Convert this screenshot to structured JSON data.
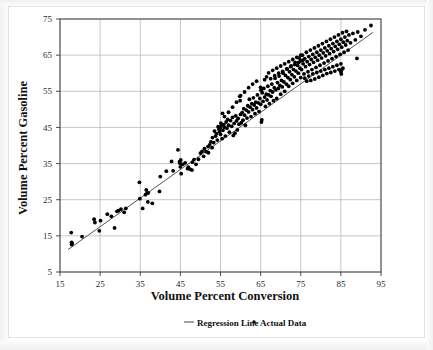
{
  "chart_data": {
    "type": "scatter",
    "title": "",
    "xlabel": "Volume Percent Conversion",
    "ylabel": "Volume Percent Gasoline",
    "xlim": [
      15,
      95
    ],
    "ylim": [
      5,
      75
    ],
    "xticks": [
      15,
      25,
      35,
      45,
      55,
      65,
      75,
      85,
      95
    ],
    "yticks": [
      5,
      15,
      25,
      35,
      45,
      55,
      65,
      75
    ],
    "grid": true,
    "legend_position": "below-bottom-center",
    "legend": [
      {
        "label": "Regression Line",
        "marker": "line",
        "color": "#555555"
      },
      {
        "label": "Actual Data",
        "marker": "dot",
        "color": "#000000"
      }
    ],
    "series": [
      {
        "name": "Regression Line",
        "type": "line",
        "color": "#555555",
        "slope": 0.79,
        "intercept": -2.2,
        "x_start": 17.0,
        "y_start": 11.2,
        "x_end": 93.0,
        "y_end": 71.3
      },
      {
        "name": "Actual Data",
        "type": "scatter",
        "color": "#000000",
        "marker_size": 1.9,
        "point_count": 281,
        "points": [
          [
            17.8,
            15.9
          ],
          [
            17.9,
            12.6
          ],
          [
            17.9,
            13.2
          ],
          [
            18.0,
            12.9
          ],
          [
            20.5,
            14.8
          ],
          [
            23.5,
            19.6
          ],
          [
            23.7,
            18.7
          ],
          [
            24.8,
            16.4
          ],
          [
            25.1,
            19.2
          ],
          [
            26.8,
            21.0
          ],
          [
            27.8,
            20.4
          ],
          [
            28.6,
            17.2
          ],
          [
            29.2,
            21.8
          ],
          [
            29.6,
            22.0
          ],
          [
            30.2,
            22.4
          ],
          [
            31.0,
            21.5
          ],
          [
            31.4,
            22.6
          ],
          [
            34.8,
            29.8
          ],
          [
            34.9,
            25.3
          ],
          [
            35.6,
            22.6
          ],
          [
            36.3,
            26.4
          ],
          [
            36.5,
            27.7
          ],
          [
            36.7,
            26.8
          ],
          [
            36.9,
            24.4
          ],
          [
            37.0,
            26.9
          ],
          [
            38.0,
            24.0
          ],
          [
            39.8,
            27.3
          ],
          [
            40.0,
            31.4
          ],
          [
            41.5,
            32.9
          ],
          [
            42.8,
            35.6
          ],
          [
            43.2,
            33.0
          ],
          [
            44.4,
            38.8
          ],
          [
            44.8,
            35.5
          ],
          [
            44.9,
            35.1
          ],
          [
            45.0,
            34.1
          ],
          [
            45.1,
            36.0
          ],
          [
            45.2,
            32.2
          ],
          [
            45.6,
            34.8
          ],
          [
            46.2,
            35.2
          ],
          [
            46.8,
            33.6
          ],
          [
            47.0,
            34.0
          ],
          [
            47.5,
            33.4
          ],
          [
            47.9,
            33.2
          ],
          [
            48.0,
            35.4
          ],
          [
            48.4,
            36.1
          ],
          [
            48.9,
            34.8
          ],
          [
            49.5,
            36.2
          ],
          [
            50.0,
            37.9
          ],
          [
            50.4,
            38.4
          ],
          [
            50.8,
            37.0
          ],
          [
            51.0,
            39.1
          ],
          [
            51.4,
            38.3
          ],
          [
            51.9,
            39.7
          ],
          [
            52.0,
            38.0
          ],
          [
            52.3,
            40.2
          ],
          [
            52.6,
            41.0
          ],
          [
            52.9,
            39.4
          ],
          [
            53.0,
            42.2
          ],
          [
            53.3,
            40.8
          ],
          [
            53.5,
            44.0
          ],
          [
            53.8,
            42.6
          ],
          [
            54.0,
            43.3
          ],
          [
            54.2,
            41.5
          ],
          [
            54.4,
            45.2
          ],
          [
            54.6,
            44.5
          ],
          [
            54.8,
            43.8
          ],
          [
            55.0,
            44.9
          ],
          [
            55.0,
            43.1
          ],
          [
            55.1,
            46.2
          ],
          [
            55.2,
            45.5
          ],
          [
            55.4,
            41.9
          ],
          [
            55.5,
            48.9
          ],
          [
            55.6,
            44.2
          ],
          [
            55.8,
            45.8
          ],
          [
            56.0,
            45.0
          ],
          [
            56.2,
            42.6
          ],
          [
            56.4,
            46.5
          ],
          [
            56.6,
            44.8
          ],
          [
            56.8,
            47.2
          ],
          [
            57.0,
            45.6
          ],
          [
            57.2,
            43.7
          ],
          [
            57.5,
            46.9
          ],
          [
            57.8,
            45.3
          ],
          [
            58.0,
            47.8
          ],
          [
            58.2,
            42.8
          ],
          [
            58.4,
            46.1
          ],
          [
            58.6,
            43.4
          ],
          [
            58.8,
            48.2
          ],
          [
            59.0,
            46.8
          ],
          [
            59.2,
            44.3
          ],
          [
            59.4,
            47.5
          ],
          [
            59.6,
            45.9
          ],
          [
            59.8,
            53.6
          ],
          [
            59.9,
            52.4
          ],
          [
            60.0,
            48.6
          ],
          [
            60.2,
            46.3
          ],
          [
            60.4,
            49.1
          ],
          [
            60.6,
            47.0
          ],
          [
            60.8,
            50.2
          ],
          [
            61.0,
            48.4
          ],
          [
            61.2,
            45.6
          ],
          [
            61.4,
            49.8
          ],
          [
            61.6,
            47.6
          ],
          [
            61.8,
            51.0
          ],
          [
            62.0,
            49.3
          ],
          [
            62.2,
            52.8
          ],
          [
            62.4,
            50.6
          ],
          [
            62.6,
            48.0
          ],
          [
            62.8,
            51.6
          ],
          [
            63.0,
            49.9
          ],
          [
            63.2,
            53.2
          ],
          [
            63.4,
            51.2
          ],
          [
            63.6,
            48.8
          ],
          [
            63.8,
            52.0
          ],
          [
            64.0,
            50.4
          ],
          [
            64.2,
            54.0
          ],
          [
            64.4,
            51.8
          ],
          [
            64.6,
            49.4
          ],
          [
            64.8,
            53.0
          ],
          [
            65.0,
            51.4
          ],
          [
            65.0,
            56.1
          ],
          [
            65.1,
            55.3
          ],
          [
            65.2,
            46.5
          ],
          [
            65.3,
            47.1
          ],
          [
            65.4,
            54.6
          ],
          [
            65.6,
            52.2
          ],
          [
            65.8,
            55.8
          ],
          [
            66.0,
            53.4
          ],
          [
            66.2,
            50.8
          ],
          [
            66.4,
            54.2
          ],
          [
            66.6,
            52.6
          ],
          [
            66.8,
            56.4
          ],
          [
            67.0,
            54.0
          ],
          [
            67.2,
            51.6
          ],
          [
            67.4,
            55.2
          ],
          [
            67.6,
            53.6
          ],
          [
            67.8,
            57.0
          ],
          [
            68.0,
            54.8
          ],
          [
            68.2,
            52.4
          ],
          [
            68.4,
            56.0
          ],
          [
            68.6,
            58.6
          ],
          [
            68.8,
            55.4
          ],
          [
            69.0,
            53.0
          ],
          [
            69.2,
            57.4
          ],
          [
            69.4,
            55.8
          ],
          [
            69.6,
            59.2
          ],
          [
            69.8,
            56.6
          ],
          [
            70.0,
            54.2
          ],
          [
            70.2,
            58.0
          ],
          [
            70.4,
            56.2
          ],
          [
            70.6,
            60.0
          ],
          [
            70.8,
            57.6
          ],
          [
            71.0,
            55.0
          ],
          [
            71.2,
            59.4
          ],
          [
            71.4,
            57.0
          ],
          [
            71.6,
            61.2
          ],
          [
            71.8,
            58.8
          ],
          [
            72.0,
            56.4
          ],
          [
            72.2,
            60.4
          ],
          [
            72.4,
            58.2
          ],
          [
            72.6,
            62.0
          ],
          [
            72.8,
            59.6
          ],
          [
            73.0,
            57.2
          ],
          [
            73.2,
            61.0
          ],
          [
            73.4,
            59.0
          ],
          [
            73.6,
            63.0
          ],
          [
            73.8,
            60.6
          ],
          [
            74.0,
            58.0
          ],
          [
            74.2,
            62.2
          ],
          [
            74.4,
            60.0
          ],
          [
            74.6,
            64.2
          ],
          [
            74.8,
            61.4
          ],
          [
            75.0,
            58.8
          ],
          [
            75.0,
            63.4
          ],
          [
            75.2,
            61.0
          ],
          [
            75.4,
            65.0
          ],
          [
            75.6,
            62.6
          ],
          [
            75.8,
            59.8
          ],
          [
            76.0,
            64.0
          ],
          [
            76.2,
            61.8
          ],
          [
            76.4,
            65.8
          ],
          [
            76.6,
            63.2
          ],
          [
            76.8,
            60.4
          ],
          [
            77.0,
            64.6
          ],
          [
            77.2,
            62.4
          ],
          [
            77.4,
            66.4
          ],
          [
            77.6,
            63.8
          ],
          [
            77.8,
            61.0
          ],
          [
            78.0,
            65.2
          ],
          [
            78.2,
            63.0
          ],
          [
            78.4,
            67.0
          ],
          [
            78.6,
            64.4
          ],
          [
            78.8,
            61.6
          ],
          [
            79.0,
            65.8
          ],
          [
            79.2,
            63.6
          ],
          [
            79.4,
            67.6
          ],
          [
            79.6,
            65.0
          ],
          [
            79.8,
            62.2
          ],
          [
            80.0,
            66.4
          ],
          [
            80.2,
            64.2
          ],
          [
            80.4,
            68.2
          ],
          [
            80.6,
            65.6
          ],
          [
            80.8,
            62.8
          ],
          [
            81.0,
            67.0
          ],
          [
            81.2,
            64.8
          ],
          [
            81.4,
            68.8
          ],
          [
            81.6,
            66.2
          ],
          [
            81.8,
            63.4
          ],
          [
            82.0,
            67.6
          ],
          [
            82.2,
            65.4
          ],
          [
            82.4,
            69.4
          ],
          [
            82.6,
            66.8
          ],
          [
            82.8,
            64.0
          ],
          [
            83.0,
            68.2
          ],
          [
            83.2,
            66.0
          ],
          [
            83.4,
            70.0
          ],
          [
            83.6,
            67.4
          ],
          [
            83.8,
            64.6
          ],
          [
            84.0,
            68.8
          ],
          [
            84.2,
            66.6
          ],
          [
            84.4,
            70.6
          ],
          [
            84.6,
            68.0
          ],
          [
            84.8,
            65.2
          ],
          [
            85.0,
            69.4
          ],
          [
            85.0,
            60.4
          ],
          [
            85.1,
            59.8
          ],
          [
            85.2,
            60.9
          ],
          [
            85.2,
            67.2
          ],
          [
            85.4,
            71.2
          ],
          [
            85.6,
            68.6
          ],
          [
            85.8,
            65.8
          ],
          [
            86.0,
            70.0
          ],
          [
            86.2,
            67.8
          ],
          [
            86.4,
            71.6
          ],
          [
            86.6,
            69.0
          ],
          [
            86.8,
            66.4
          ],
          [
            87.0,
            70.6
          ],
          [
            87.4,
            68.4
          ],
          [
            88.0,
            71.0
          ],
          [
            88.6,
            69.2
          ],
          [
            89.0,
            64.1
          ],
          [
            89.2,
            71.4
          ],
          [
            90.0,
            70.2
          ],
          [
            91.0,
            72.0
          ],
          [
            92.5,
            73.2
          ],
          [
            66.0,
            58.2
          ],
          [
            66.5,
            59.0
          ],
          [
            67.0,
            60.1
          ],
          [
            67.5,
            58.5
          ],
          [
            68.0,
            60.8
          ],
          [
            68.5,
            59.3
          ],
          [
            69.0,
            61.4
          ],
          [
            69.5,
            60.0
          ],
          [
            70.0,
            62.0
          ],
          [
            70.5,
            60.5
          ],
          [
            71.0,
            62.6
          ],
          [
            71.5,
            61.2
          ],
          [
            72.0,
            63.2
          ],
          [
            72.5,
            61.8
          ],
          [
            73.0,
            63.8
          ],
          [
            73.5,
            62.4
          ],
          [
            74.0,
            64.4
          ],
          [
            74.5,
            63.0
          ],
          [
            75.0,
            65.0
          ],
          [
            75.5,
            63.6
          ],
          [
            76.0,
            58.6
          ],
          [
            76.5,
            57.8
          ],
          [
            77.0,
            59.2
          ],
          [
            77.5,
            58.0
          ],
          [
            78.0,
            59.8
          ],
          [
            78.5,
            58.4
          ],
          [
            79.0,
            60.2
          ],
          [
            79.5,
            58.9
          ],
          [
            80.0,
            60.6
          ],
          [
            80.5,
            59.4
          ],
          [
            81.0,
            61.0
          ],
          [
            81.5,
            59.9
          ],
          [
            82.0,
            61.4
          ],
          [
            82.5,
            60.2
          ],
          [
            83.0,
            61.8
          ],
          [
            83.5,
            60.6
          ],
          [
            84.0,
            62.2
          ],
          [
            84.5,
            61.0
          ],
          [
            85.0,
            62.6
          ],
          [
            85.5,
            61.4
          ],
          [
            62.0,
            56.0
          ],
          [
            63.0,
            57.0
          ],
          [
            64.0,
            57.8
          ],
          [
            61.0,
            54.8
          ],
          [
            60.0,
            53.8
          ],
          [
            59.0,
            52.0
          ],
          [
            58.0,
            50.6
          ],
          [
            57.0,
            49.2
          ],
          [
            56.0,
            48.0
          ]
        ]
      }
    ]
  },
  "axes": {
    "x_title": "Volume Percent Conversion",
    "y_title": "Volume Percent Gasoline",
    "x_tick_labels": [
      "15",
      "25",
      "35",
      "45",
      "55",
      "65",
      "75",
      "85",
      "95"
    ],
    "y_tick_labels": [
      "75",
      "65",
      "55",
      "45",
      "35",
      "25",
      "15",
      "5"
    ]
  },
  "legend": {
    "regression_label": "Regression Line",
    "actual_label": "Actual Data"
  },
  "colors": {
    "point": "#000000",
    "regression_line": "#555555",
    "grid": "#b8b8b8",
    "frame": "#3a3a3a",
    "background": "#ffffff",
    "text": "#111111"
  }
}
